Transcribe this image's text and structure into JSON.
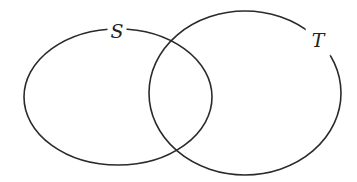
{
  "diagram": {
    "type": "venn",
    "stroke_color": "#2a2a2a",
    "background": "#ffffff",
    "sets": [
      {
        "label": "S",
        "cx": 118,
        "cy": 97,
        "rx": 94,
        "ry": 68,
        "label_x": 117,
        "label_y": 31
      },
      {
        "label": "T",
        "cx": 245,
        "cy": 93,
        "rx": 96,
        "ry": 82,
        "label_x": 318,
        "label_y": 39
      }
    ]
  }
}
